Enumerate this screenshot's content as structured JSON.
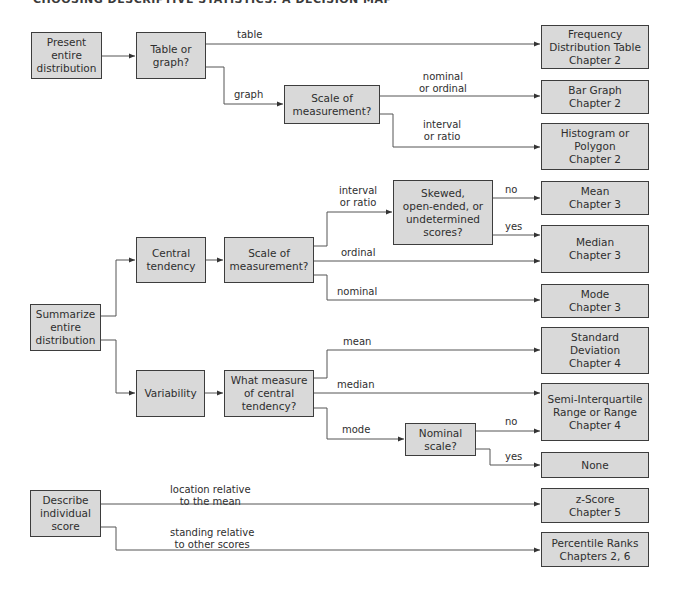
{
  "title": "CHOOSING DESCRIPTIVE STATISTICS: A DECISION MAP",
  "colors": {
    "box_fill": "#d9d9d9",
    "box_border": "#3d3d3d",
    "line": "#555555",
    "text": "#2e2e2e"
  },
  "nodes": {
    "present": "Present\nentire\ndistribution",
    "table_or_graph": "Table or\ngraph?",
    "scale_top": "Scale of\nmeasurement?",
    "freq_table": "Frequency\nDistribution Table\nChapter 2",
    "bar_graph": "Bar Graph\nChapter 2",
    "histogram": "Histogram or\nPolygon\nChapter 2",
    "summarize": "Summarize\nentire\ndistribution",
    "central_tendency": "Central\ntendency",
    "scale_mid": "Scale of\nmeasurement?",
    "skewed": "Skewed,\nopen-ended, or\nundetermined\nscores?",
    "mean": "Mean\nChapter 3",
    "median": "Median\nChapter 3",
    "mode": "Mode\nChapter 3",
    "variability": "Variability",
    "what_measure": "What measure\nof central\ntendency?",
    "std_dev": "Standard\nDeviation\nChapter 4",
    "semi_iqr": "Semi-Interquartile\nRange or Range\nChapter 4",
    "nominal_scale": "Nominal\nscale?",
    "none": "None",
    "describe": "Describe\nindividual\nscore",
    "z_score": "z-Score\nChapter 5",
    "percentile": "Percentile Ranks\nChapters 2, 6"
  },
  "edge_labels": {
    "table": "table",
    "graph": "graph",
    "nominal_or_ordinal": "nominal\nor ordinal",
    "interval_or_ratio_top": "interval\nor ratio",
    "interval_or_ratio_mid": "interval\nor ratio",
    "no_mean": "no",
    "yes_median": "yes",
    "ordinal": "ordinal",
    "nominal": "nominal",
    "mean": "mean",
    "median": "median",
    "mode": "mode",
    "no_semi": "no",
    "yes_none": "yes",
    "location_relative": "location relative\nto the mean",
    "standing_relative": "standing relative\nto other scores"
  }
}
